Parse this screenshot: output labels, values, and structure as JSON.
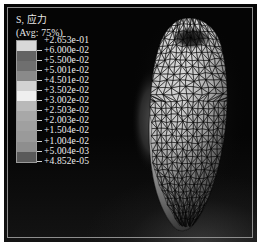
{
  "figure": {
    "background_color": "#050505",
    "frame_color": "#8d8d8d",
    "text_color": "#ededed",
    "type": "fea-contour-plot"
  },
  "legend": {
    "title": "S, 应力",
    "average": "(Avg: 75%)",
    "labels": [
      "+2.653e-01",
      "+6.000e-02",
      "+5.500e-02",
      "+5.001e-02",
      "+4.501e-02",
      "+3.502e-02",
      "+3.002e-02",
      "+2.503e-02",
      "+2.003e-02",
      "+1.504e-02",
      "+1.004e-02",
      "+5.004e-03",
      "+4.852e-05"
    ],
    "swatch_colors": [
      "#d8d8d8",
      "#636363",
      "#6f6f6f",
      "#8a8a8a",
      "#d2d2d2",
      "#efefef",
      "#b9b9b9",
      "#a8a8a8",
      "#a0a0a0",
      "#9a9a9a",
      "#8e8e8e",
      "#5a5a5a"
    ]
  },
  "model": {
    "name": "tooth-root-mesh",
    "description": "triangulated surface mesh, stress contour shaded",
    "mesh_color": "#0a0a0a",
    "fill_light": "#c9c9c9",
    "fill_dark": "#2a2a2a"
  },
  "chart_data": {
    "type": "heatmap",
    "title": "S, 应力",
    "subtitle": "(Avg: 75%)",
    "xlabel": "",
    "ylabel": "",
    "legend_position": "left",
    "grid": false,
    "colormap": "grayscale",
    "contour_levels": [
      4.852e-05,
      0.005004,
      0.01004,
      0.01504,
      0.02003,
      0.02503,
      0.03002,
      0.03502,
      0.04501,
      0.05001,
      0.055,
      0.06,
      0.2653
    ],
    "level_labels": [
      "+2.653e-01",
      "+6.000e-02",
      "+5.500e-02",
      "+5.001e-02",
      "+4.501e-02",
      "+3.502e-02",
      "+3.002e-02",
      "+2.503e-02",
      "+2.003e-02",
      "+1.504e-02",
      "+1.004e-02",
      "+5.004e-03",
      "+4.852e-05"
    ],
    "min_value": 4.852e-05,
    "max_value": 0.2653,
    "units": "",
    "annotations": []
  }
}
